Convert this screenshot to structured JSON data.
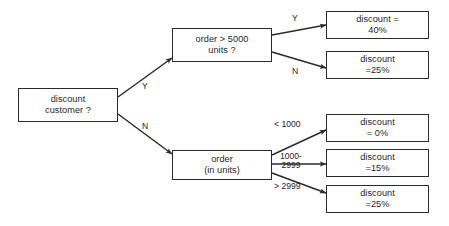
{
  "diagram": {
    "type": "decision-tree",
    "background_color": "#ffffff",
    "line_color": "#2b2b2b",
    "text_color": "#1f1f1f",
    "nodes": [
      {
        "id": "root",
        "kind": "decision",
        "text": "discount\ncustomer ?",
        "x": 18,
        "y": 88,
        "w": 100,
        "h": 34
      },
      {
        "id": "order5000",
        "kind": "decision",
        "text": "order > 5000\nunits ?",
        "x": 172,
        "y": 28,
        "w": 100,
        "h": 34
      },
      {
        "id": "orderunits",
        "kind": "decision",
        "text": "order\n(in units)",
        "x": 172,
        "y": 150,
        "w": 100,
        "h": 30
      },
      {
        "id": "d40",
        "kind": "result",
        "text": "discount =\n40%",
        "x": 326,
        "y": 11,
        "w": 103,
        "h": 28
      },
      {
        "id": "d25top",
        "kind": "result",
        "text": "discount\n=25%",
        "x": 326,
        "y": 51,
        "w": 103,
        "h": 28
      },
      {
        "id": "d0",
        "kind": "result",
        "text": "discount\n= 0%",
        "x": 326,
        "y": 114,
        "w": 103,
        "h": 28
      },
      {
        "id": "d15",
        "kind": "result",
        "text": "discount\n=15%",
        "x": 326,
        "y": 149,
        "w": 103,
        "h": 28
      },
      {
        "id": "d25bottom",
        "kind": "result",
        "text": "discount\n=25%",
        "x": 326,
        "y": 185,
        "w": 103,
        "h": 28
      }
    ],
    "edges": [
      {
        "id": "root-yes",
        "from": "root",
        "to": "order5000",
        "label": "Y",
        "x1": 118,
        "y1": 97,
        "x2": 172,
        "y2": 58
      },
      {
        "id": "root-no",
        "from": "root",
        "to": "orderunits",
        "label": "N",
        "x1": 118,
        "y1": 114,
        "x2": 172,
        "y2": 154
      },
      {
        "id": "o5000-yes",
        "from": "order5000",
        "to": "d40",
        "label": "Y",
        "x1": 272,
        "y1": 35,
        "x2": 326,
        "y2": 25
      },
      {
        "id": "o5000-no",
        "from": "order5000",
        "to": "d25top",
        "label": "N",
        "x1": 272,
        "y1": 52,
        "x2": 326,
        "y2": 68
      },
      {
        "id": "ou-lt1000",
        "from": "orderunits",
        "to": "d0",
        "label": "< 1000",
        "x1": 272,
        "y1": 155,
        "x2": 326,
        "y2": 130
      },
      {
        "id": "ou-mid",
        "from": "orderunits",
        "to": "d15",
        "label": "1000-\n2999",
        "x1": 272,
        "y1": 164,
        "x2": 326,
        "y2": 164
      },
      {
        "id": "ou-gt2999",
        "from": "orderunits",
        "to": "d25bottom",
        "label": "> 2999",
        "x1": 272,
        "y1": 173,
        "x2": 326,
        "y2": 193
      }
    ],
    "edge_labels": [
      {
        "id": "label-root-yes",
        "text": "Y",
        "x": 142,
        "y": 82
      },
      {
        "id": "label-root-no",
        "text": "N",
        "x": 142,
        "y": 122
      },
      {
        "id": "label-o5000-yes",
        "text": "Y",
        "x": 292,
        "y": 14
      },
      {
        "id": "label-o5000-no",
        "text": "N",
        "x": 292,
        "y": 67
      },
      {
        "id": "label-lt1000",
        "text": "< 1000",
        "x": 274,
        "y": 120
      },
      {
        "id": "label-mid",
        "text": "1000-\n2999",
        "x": 280,
        "y": 152
      },
      {
        "id": "label-gt2999",
        "text": "> 2999",
        "x": 274,
        "y": 182
      }
    ]
  }
}
